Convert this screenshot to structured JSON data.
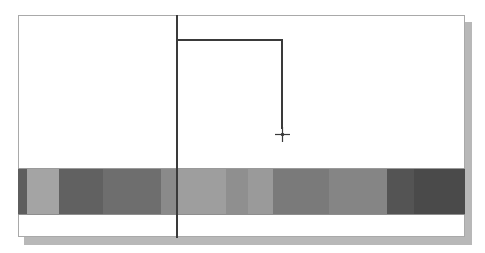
{
  "canvas": {
    "background": "#ffffff",
    "panel_border": "#a9a9a9",
    "shadow": "#b8b8b8",
    "line_color": "#3a3a3a"
  },
  "gradient_band": {
    "segments": [
      {
        "width": 9,
        "color": "#5e5e5e"
      },
      {
        "width": 32,
        "color": "#a4a4a4"
      },
      {
        "width": 44,
        "color": "#616161"
      },
      {
        "width": 58,
        "color": "#6e6e6e"
      },
      {
        "width": 16,
        "color": "#8a8a8a"
      },
      {
        "width": 49,
        "color": "#9e9e9e"
      },
      {
        "width": 22,
        "color": "#8f8f8f"
      },
      {
        "width": 25,
        "color": "#9a9a9a"
      },
      {
        "width": 56,
        "color": "#7a7a7a"
      },
      {
        "width": 58,
        "color": "#858585"
      },
      {
        "width": 27,
        "color": "#545454"
      },
      {
        "width": 51,
        "color": "#4a4a4a"
      }
    ]
  },
  "cursor": {
    "type": "crosshair-icon",
    "x": 282,
    "y": 134
  }
}
